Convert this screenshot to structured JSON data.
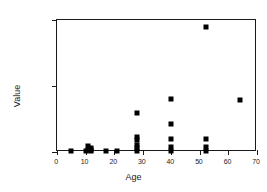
{
  "chart_data": {
    "type": "scatter",
    "title": "",
    "xlabel": "Age",
    "ylabel": "Value",
    "xlim": [
      0,
      70
    ],
    "ylim": [
      0,
      2000
    ],
    "xticks": [
      0,
      10,
      20,
      30,
      40,
      50,
      60,
      70
    ],
    "yticks": [
      0,
      1000,
      2000
    ],
    "grid": false,
    "legend": null,
    "marker": "square",
    "marker_color": "#000000",
    "points": [
      {
        "x": 5,
        "y": 20
      },
      {
        "x": 10,
        "y": 20
      },
      {
        "x": 11,
        "y": 30
      },
      {
        "x": 11,
        "y": 95
      },
      {
        "x": 12,
        "y": 60
      },
      {
        "x": 12,
        "y": 30
      },
      {
        "x": 12,
        "y": 20
      },
      {
        "x": 17,
        "y": 20
      },
      {
        "x": 21,
        "y": 20
      },
      {
        "x": 28,
        "y": 20
      },
      {
        "x": 28,
        "y": 60
      },
      {
        "x": 28,
        "y": 110
      },
      {
        "x": 28,
        "y": 180
      },
      {
        "x": 28,
        "y": 230
      },
      {
        "x": 28,
        "y": 590
      },
      {
        "x": 40,
        "y": 20
      },
      {
        "x": 40,
        "y": 70
      },
      {
        "x": 40,
        "y": 190
      },
      {
        "x": 40,
        "y": 420
      },
      {
        "x": 40,
        "y": 810
      },
      {
        "x": 52,
        "y": 20
      },
      {
        "x": 52,
        "y": 70
      },
      {
        "x": 52,
        "y": 190
      },
      {
        "x": 52,
        "y": 1900
      },
      {
        "x": 64,
        "y": 790
      }
    ]
  },
  "axis": {
    "xlabel": "Age",
    "ylabel": "Value",
    "xtick_labels": [
      "0",
      "10",
      "20",
      "30",
      "40",
      "50",
      "60",
      "70"
    ],
    "ytick_labels": [
      "0",
      "1000",
      "2000"
    ]
  }
}
